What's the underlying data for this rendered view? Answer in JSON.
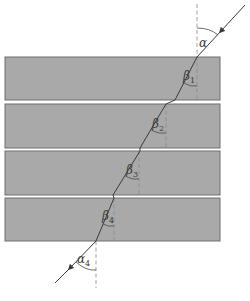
{
  "figure": {
    "type": "refraction-through-layered-slabs",
    "caption": "",
    "slab_count": 4,
    "slab_color": "#a9a9a9",
    "labels": {
      "alpha_in": "α",
      "beta_1": "β",
      "beta_1_sub": "1",
      "beta_2": "β",
      "beta_2_sub": "2",
      "beta_3": "β",
      "beta_3_sub": "3",
      "beta_4": "β",
      "beta_4_sub": "4",
      "alpha_out": "α",
      "alpha_out_sub": "4"
    }
  }
}
